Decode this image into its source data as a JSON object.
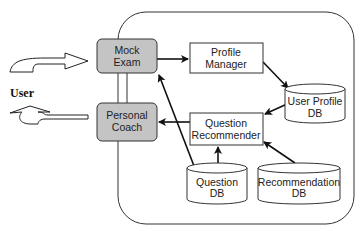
{
  "diagram": {
    "user_label": "User",
    "nodes": {
      "mock_exam": {
        "line1": "Mock",
        "line2": "Exam"
      },
      "personal_coach": {
        "line1": "Personal",
        "line2": "Coach"
      },
      "profile_manager": {
        "line1": "Profile",
        "line2": "Manager"
      },
      "question_recommender": {
        "line1": "Question",
        "line2": "Recommender"
      },
      "user_profile_db": {
        "line1": "User Profile",
        "line2": "DB"
      },
      "question_db": {
        "line1": "Question",
        "line2": "DB"
      },
      "recommendation_db": {
        "line1": "Recommendation",
        "line2": "DB"
      }
    },
    "colors": {
      "highlight_fill": "#c4c4c4",
      "stroke": "#222222"
    }
  }
}
